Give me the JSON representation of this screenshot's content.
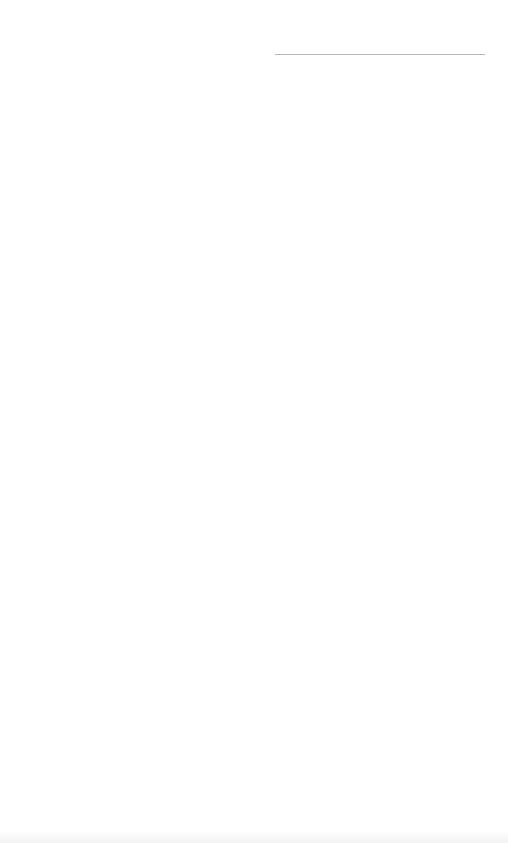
{
  "page": {
    "type": "lined-paper",
    "background": "#ffffff",
    "line_color": "#bdbdbd",
    "header_line": {
      "x": 275,
      "y": 54,
      "width": 210
    },
    "ruled_lines": {
      "count": 22,
      "start_y": 120,
      "spacing": 32.8,
      "x": 30,
      "width": 455
    }
  }
}
